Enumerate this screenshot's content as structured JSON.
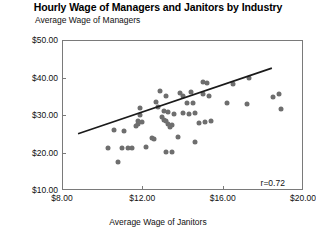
{
  "chart_data": {
    "type": "scatter",
    "title": "Hourly Wage of Managers and Janitors by Industry",
    "ylabel": "Average Wage of Managers",
    "xlabel": "Average Wage of Janitors",
    "xlim": [
      8.0,
      20.0
    ],
    "ylim": [
      10.0,
      50.0
    ],
    "xticks": [
      8.0,
      12.0,
      16.0,
      20.0
    ],
    "xtick_labels": [
      "$8.00",
      "$12.00",
      "$16.00",
      "$20.00"
    ],
    "yticks": [
      10.0,
      20.0,
      30.0,
      40.0,
      50.0
    ],
    "ytick_labels": [
      "$10.00",
      "$20.00",
      "$30.00",
      "$40.00",
      "$50.00"
    ],
    "grid": false,
    "legend": null,
    "annotations": [
      {
        "text": "r=0.72",
        "x": 19.1,
        "y": 11.9,
        "position": "bottom-right"
      }
    ],
    "marker_color": "#6e6e6e",
    "line_color": "#1a1a1a",
    "frame_color": "#7a7a7a",
    "series": [
      {
        "name": "Industries",
        "points": [
          [
            10.8,
            17.5
          ],
          [
            10.3,
            21.3
          ],
          [
            11.0,
            21.2
          ],
          [
            11.3,
            21.3
          ],
          [
            11.5,
            21.3
          ],
          [
            10.6,
            26.0
          ],
          [
            11.1,
            25.8
          ],
          [
            12.2,
            21.6
          ],
          [
            13.2,
            20.2
          ],
          [
            13.5,
            20.2
          ],
          [
            11.9,
            30.0
          ],
          [
            11.7,
            27.2
          ],
          [
            11.8,
            27.6
          ],
          [
            11.8,
            28.4
          ],
          [
            12.0,
            28.1
          ],
          [
            11.9,
            32.0
          ],
          [
            13.0,
            29.5
          ],
          [
            13.1,
            28.7
          ],
          [
            13.2,
            28.4
          ],
          [
            13.3,
            27.6
          ],
          [
            13.4,
            26.9
          ],
          [
            13.5,
            27.3
          ],
          [
            13.1,
            31.0
          ],
          [
            13.3,
            30.8
          ],
          [
            13.6,
            30.4
          ],
          [
            14.0,
            30.6
          ],
          [
            14.3,
            30.4
          ],
          [
            14.6,
            30.6
          ],
          [
            14.2,
            33.1
          ],
          [
            14.5,
            33.2
          ],
          [
            14.0,
            35.2
          ],
          [
            13.9,
            36.0
          ],
          [
            14.4,
            36.1
          ],
          [
            13.2,
            35.1
          ],
          [
            12.9,
            36.3
          ],
          [
            12.7,
            33.6
          ],
          [
            12.8,
            32.2
          ],
          [
            15.0,
            35.5
          ],
          [
            15.3,
            35.2
          ],
          [
            15.2,
            38.5
          ],
          [
            15.0,
            38.7
          ],
          [
            14.6,
            22.8
          ],
          [
            14.8,
            28.0
          ],
          [
            15.1,
            28.1
          ],
          [
            15.4,
            28.3
          ],
          [
            13.8,
            24.2
          ],
          [
            16.5,
            38.2
          ],
          [
            17.3,
            39.9
          ],
          [
            17.2,
            33.0
          ],
          [
            18.5,
            34.8
          ],
          [
            18.9,
            31.7
          ],
          [
            18.8,
            35.6
          ],
          [
            16.2,
            33.3
          ],
          [
            12.5,
            23.8
          ],
          [
            12.6,
            23.7
          ]
        ]
      }
    ],
    "trendline": {
      "x0": 8.8,
      "y0": 25.0,
      "x1": 18.45,
      "y1": 42.5,
      "correlation": "r=0.72"
    }
  }
}
